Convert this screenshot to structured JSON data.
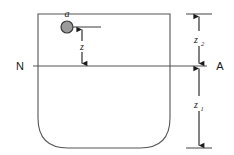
{
  "figure": {
    "type": "technical-diagram",
    "background_color": "#ffffff",
    "vessel": {
      "name": "vessel-outline",
      "stroke_color": "#555555",
      "fill_color": "none",
      "left": 38,
      "right": 170,
      "top": 14,
      "bottom": 148,
      "corner_radius_bottom": 30,
      "corner_radius_top": 0
    },
    "particle": {
      "label": "a",
      "name": "particle-a",
      "center_x": 67,
      "center_y": 27,
      "radius": 6,
      "fill_color": "#9b9b9b",
      "stroke_color": "#3a3a3a"
    },
    "centerline": {
      "left_label": "N",
      "right_label": "A",
      "y": 66,
      "x_start": 22,
      "x_end": 212,
      "stroke_color": "#555555"
    },
    "dimensions": [
      {
        "id": "z",
        "label": "z",
        "subscript": "",
        "name": "dimension-z",
        "x": 82,
        "y_top": 27,
        "y_bottom": 66,
        "description": "depth of particle a below line N-A"
      },
      {
        "id": "z2",
        "label": "z",
        "subscript": "2",
        "name": "dimension-z2",
        "x": 199,
        "y_top": 14,
        "y_bottom": 66,
        "description": "height from line N-A to vessel top"
      },
      {
        "id": "z1",
        "label": "z",
        "subscript": "1",
        "name": "dimension-z1",
        "x": 199,
        "y_top": 66,
        "y_bottom": 148,
        "description": "depth from line N-A to vessel bottom"
      }
    ],
    "colors": {
      "line": "#555555",
      "arrow": "#1a1a1a",
      "particle_fill": "#9b9b9b",
      "text": "#1a1a1a"
    }
  }
}
